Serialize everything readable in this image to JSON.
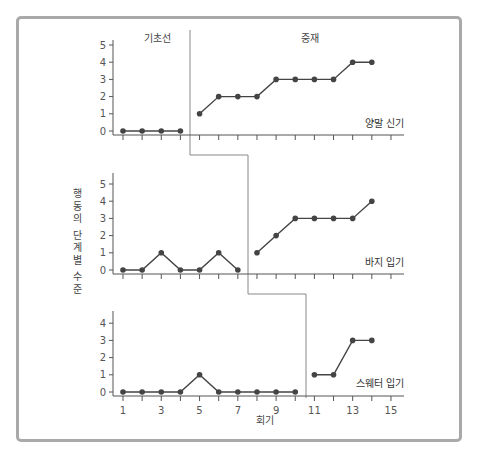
{
  "chart_data": {
    "type": "line",
    "title": "",
    "design": "multiple baseline across behaviors",
    "xlabel": "회기",
    "ylabel": "행동의 단계별 수준",
    "phases": [
      "기초선",
      "중재"
    ],
    "x_ticks": [
      1,
      3,
      5,
      7,
      9,
      11,
      13,
      15
    ],
    "xlim": [
      1,
      15
    ],
    "grid": false,
    "panels": [
      {
        "name": "양말 신기",
        "ylim": [
          0,
          5
        ],
        "y_ticks": [
          0,
          1,
          2,
          3,
          4,
          5
        ],
        "baseline": {
          "x": [
            1,
            2,
            3,
            4
          ],
          "y": [
            0,
            0,
            0,
            0
          ]
        },
        "intervention": {
          "x": [
            5,
            6,
            7,
            8,
            9,
            10,
            11,
            12,
            13,
            14
          ],
          "y": [
            1,
            2,
            2,
            2,
            3,
            3,
            3,
            3,
            4,
            4
          ]
        }
      },
      {
        "name": "바지 입기",
        "ylim": [
          0,
          5
        ],
        "y_ticks": [
          0,
          1,
          2,
          3,
          4,
          5
        ],
        "baseline": {
          "x": [
            1,
            2,
            3,
            4,
            5,
            6,
            7
          ],
          "y": [
            0,
            0,
            1,
            0,
            0,
            1,
            0
          ]
        },
        "intervention": {
          "x": [
            8,
            9,
            10,
            11,
            12,
            13,
            14
          ],
          "y": [
            1,
            2,
            3,
            3,
            3,
            3,
            4
          ]
        }
      },
      {
        "name": "스웨터 입기",
        "ylim": [
          0,
          4
        ],
        "y_ticks": [
          0,
          1,
          2,
          3,
          4
        ],
        "baseline": {
          "x": [
            1,
            2,
            3,
            4,
            5,
            6,
            7,
            8,
            9,
            10
          ],
          "y": [
            0,
            0,
            0,
            0,
            1,
            0,
            0,
            0,
            0,
            0
          ]
        },
        "intervention": {
          "x": [
            11,
            12,
            13,
            14
          ],
          "y": [
            1,
            1,
            3,
            3
          ]
        }
      }
    ]
  },
  "labels": {
    "phase_baseline": "기초선",
    "phase_intervention": "중재",
    "ylabel": "행동의 단계별 수준",
    "xlabel": "회기",
    "panel1": "양말 신기",
    "panel2": "바지 입기",
    "panel3": "스웨터 입기"
  },
  "colors": {
    "frame": "#a9a9a9",
    "axis": "#555555",
    "data": "#444444",
    "phase_line": "#888888"
  }
}
